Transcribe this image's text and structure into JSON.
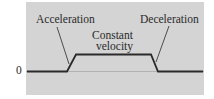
{
  "diagram": {
    "type": "velocity-time profile (trapezoid)",
    "labels": {
      "acceleration": "Acceleration",
      "constant_velocity_line1": "Constant",
      "constant_velocity_line2": "velocity",
      "deceleration": "Deceleration",
      "zero": "0"
    },
    "colors": {
      "panel": "#d4d4d4",
      "line": "#2a2a2a"
    },
    "profile_points": [
      [
        26,
        71
      ],
      [
        67,
        71
      ],
      [
        77,
        54
      ],
      [
        151,
        54
      ],
      [
        158,
        71
      ],
      [
        204,
        71
      ]
    ]
  }
}
